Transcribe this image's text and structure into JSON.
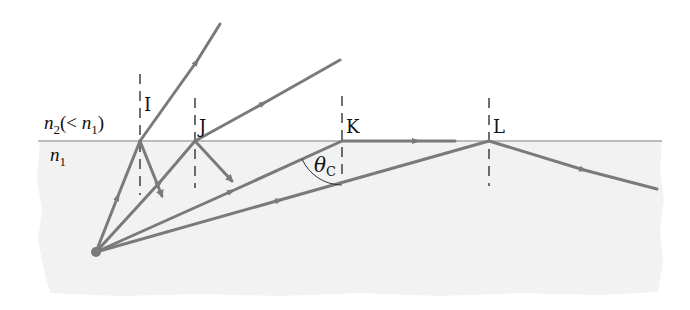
{
  "diagram": {
    "type": "optics-total-internal-reflection",
    "colors": {
      "ray": "#7a7a7a",
      "interface": "#a8a8a8",
      "dense_medium_fill": "#f2f2f2",
      "normal_line": "#222222",
      "text": "#111111"
    },
    "media": {
      "upper": {
        "label_main": "n",
        "label_sub": "2",
        "label_rest_open": "(< ",
        "label_rest_n": "n",
        "label_rest_sub": "1",
        "label_rest_close": ")"
      },
      "lower": {
        "label_main": "n",
        "label_sub": "1"
      }
    },
    "points": [
      {
        "id": "I",
        "label": "I"
      },
      {
        "id": "J",
        "label": "J"
      },
      {
        "id": "K",
        "label": "K"
      },
      {
        "id": "L",
        "label": "L"
      }
    ],
    "angle": {
      "symbol": "θ",
      "subscript": "C",
      "meaning": "critical angle"
    }
  }
}
